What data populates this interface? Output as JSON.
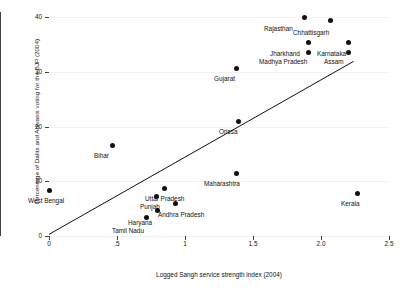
{
  "axes": {
    "ylabel": "Percentage of Dalits and Adivasis voting for the BJP (2004)",
    "xlabel": "Logged Sangh service strength index (2004)",
    "yticks": [
      "0",
      "10",
      "20",
      "30",
      "40"
    ],
    "xticks": [
      "0",
      ".5",
      "1",
      "1.5",
      "2.0",
      "2.5"
    ]
  },
  "chart_data": {
    "type": "scatter",
    "title": "",
    "xlabel": "Logged Sangh service strength index (2004)",
    "ylabel": "Percentage of Dalits and Adivasis voting for the BJP (2004)",
    "xlim": [
      0,
      2.5
    ],
    "ylim": [
      0,
      40
    ],
    "xticks": [
      0,
      0.5,
      1,
      1.5,
      2.0,
      2.5
    ],
    "yticks": [
      0,
      10,
      20,
      30,
      40
    ],
    "grid": true,
    "legend": "none",
    "points": [
      {
        "label": "Rajasthan",
        "x": 1.88,
        "y": 40.0,
        "lx": 264,
        "ly": 25
      },
      {
        "label": "Chhattisgarh",
        "x": 2.07,
        "y": 39.3,
        "lx": 293,
        "ly": 29
      },
      {
        "label": "Jharkhand",
        "x": 1.91,
        "y": 35.3,
        "lx": 270,
        "ly": 50
      },
      {
        "label": "Karnataka",
        "x": 2.2,
        "y": 35.3,
        "lx": 317,
        "ly": 50
      },
      {
        "label": "Madhya Pradesh",
        "x": 1.91,
        "y": 33.5,
        "lx": 259,
        "ly": 58
      },
      {
        "label": "Assam",
        "x": 2.2,
        "y": 33.5,
        "lx": 324,
        "ly": 58
      },
      {
        "label": "Gujarat",
        "x": 1.38,
        "y": 30.6,
        "lx": 214,
        "ly": 75
      },
      {
        "label": "Orissa",
        "x": 1.39,
        "y": 21.0,
        "lx": 219,
        "ly": 128
      },
      {
        "label": "Bihar",
        "x": 0.47,
        "y": 16.5,
        "lx": 94,
        "ly": 152
      },
      {
        "label": "Maharashtra",
        "x": 1.38,
        "y": 11.5,
        "lx": 204,
        "ly": 180
      },
      {
        "label": "West Bengal",
        "x": 0.0,
        "y": 8.3,
        "lx": 28,
        "ly": 197
      },
      {
        "label": "Kerala",
        "x": 2.27,
        "y": 7.8,
        "lx": 341,
        "ly": 200
      },
      {
        "label": "Uttar Pradesh",
        "x": 0.85,
        "y": 8.7,
        "lx": 145,
        "ly": 195
      },
      {
        "label": "Punjab",
        "x": 0.79,
        "y": 7.2,
        "lx": 140,
        "ly": 203
      },
      {
        "label": "Andhra Pradesh",
        "x": 0.93,
        "y": 5.9,
        "lx": 158,
        "ly": 211
      },
      {
        "label": "Haryana",
        "x": 0.8,
        "y": 4.6,
        "lx": 128,
        "ly": 219
      },
      {
        "label": "Tamil Nadu",
        "x": 0.72,
        "y": 3.3,
        "lx": 112,
        "ly": 227
      }
    ],
    "fit_line": {
      "x0": 0.0,
      "y0": 0.3,
      "x1": 2.24,
      "y1": 31.9
    }
  }
}
